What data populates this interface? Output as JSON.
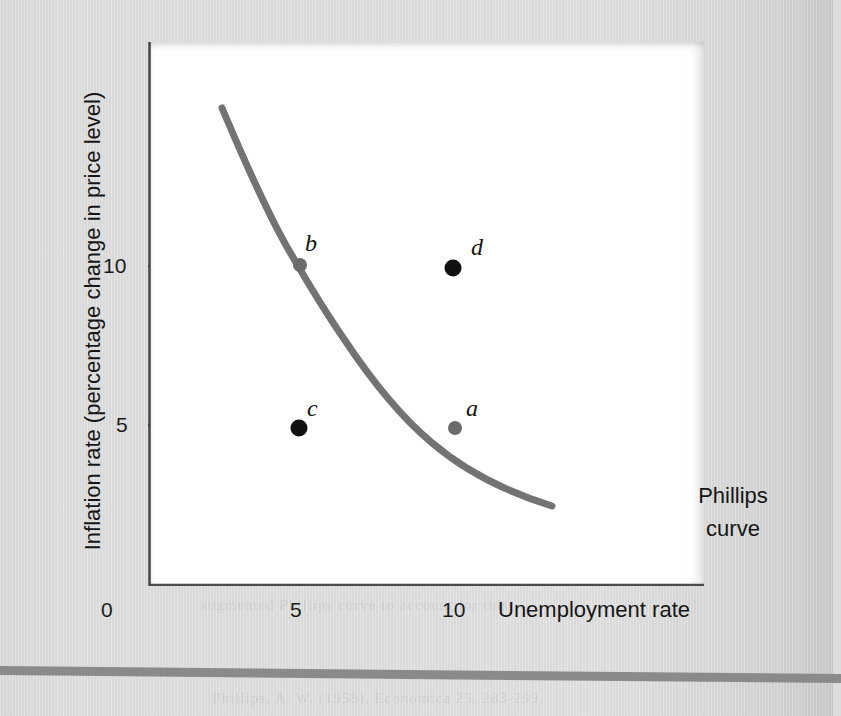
{
  "figure": {
    "background_color": "#dcdcdc",
    "panel_color": "#ffffff",
    "curve_color": "#737373",
    "point_color": "#111111",
    "axis_color": "#4a4a4a",
    "rule_color": "#8a8a8a"
  },
  "axes": {
    "y_title": "Inflation rate (percentage change in price level)",
    "x_title": "Unemployment rate",
    "origin_label": "0",
    "y_ticks": [
      "10",
      "5"
    ],
    "x_ticks": [
      "5",
      "10"
    ]
  },
  "annotations": {
    "curve_line1": "Phillips",
    "curve_line2": "curve"
  },
  "points": [
    {
      "id": "b",
      "label": "b",
      "x": 5,
      "y": 10,
      "on_curve": true,
      "px": 300,
      "py": 265
    },
    {
      "id": "d",
      "label": "d",
      "x": 10,
      "y": 10,
      "on_curve": false,
      "px": 453,
      "py": 268
    },
    {
      "id": "c",
      "label": "c",
      "x": 5,
      "y": 5,
      "on_curve": false,
      "px": 299,
      "py": 428
    },
    {
      "id": "a",
      "label": "a",
      "x": 10,
      "y": 5,
      "on_curve": true,
      "px": 455,
      "py": 428
    }
  ],
  "ghost_text": [
    {
      "text": "and the rate of unemployment. It implies that",
      "x": 196,
      "y": 86
    },
    {
      "text": "lower unemployment, while lower inflation",
      "x": 210,
      "y": 122
    },
    {
      "text": "the cost of higher unemployment. The curve",
      "x": 196,
      "y": 157
    },
    {
      "text": "was thought to be stable and reliable.",
      "x": 215,
      "y": 192
    },
    {
      "text": "The Breakdown",
      "x": 470,
      "y": 318
    },
    {
      "text": "during the 1970s the relationship broke down.",
      "x": 196,
      "y": 362
    },
    {
      "text": "Both inflation and unemployment rose at the",
      "x": 200,
      "y": 398
    },
    {
      "text": "same time, a phenomenon that came to be",
      "x": 206,
      "y": 433
    },
    {
      "text": "known as stagflation, which the simple curve",
      "x": 198,
      "y": 468
    },
    {
      "text": "could not explain at all.",
      "x": 214,
      "y": 503
    },
    {
      "text": "Economists then developed the expectations-",
      "x": 196,
      "y": 548
    },
    {
      "text": "augmented Phillips curve to account for this.",
      "x": 200,
      "y": 597
    },
    {
      "text": "Phillips, A. W. (1958), Economica 25, 283-299.",
      "x": 212,
      "y": 690
    }
  ],
  "chart_data": {
    "type": "line",
    "title": "",
    "xlabel": "Unemployment rate",
    "ylabel": "Inflation rate (percentage change in price level)",
    "xlim": [
      0,
      18.3
    ],
    "ylim": [
      0,
      17.1
    ],
    "x_ticks": [
      5,
      10
    ],
    "y_ticks": [
      5,
      10
    ],
    "grid": false,
    "legend": "none",
    "series": [
      {
        "name": "Phillips curve",
        "type": "line",
        "color": "#737373",
        "x": [
          2.45,
          3.0,
          3.6,
          4.2,
          5.0,
          5.8,
          6.6,
          7.5,
          8.4,
          9.2,
          10.0,
          11.2,
          12.4,
          13.6,
          15.0,
          15.4
        ],
        "y": [
          15.0,
          13.9,
          12.9,
          11.9,
          10.0,
          9.1,
          8.3,
          7.5,
          6.7,
          6.1,
          5.0,
          4.5,
          4.1,
          3.7,
          3.35,
          3.3
        ]
      },
      {
        "name": "labeled points",
        "type": "scatter",
        "color": "#111111",
        "points": [
          {
            "label": "b",
            "x": 5,
            "y": 10
          },
          {
            "label": "d",
            "x": 10,
            "y": 10
          },
          {
            "label": "c",
            "x": 5,
            "y": 5
          },
          {
            "label": "a",
            "x": 10,
            "y": 5
          }
        ]
      }
    ],
    "annotations": [
      {
        "text": "Phillips curve",
        "x": 13.0,
        "y": 4.6
      }
    ]
  }
}
